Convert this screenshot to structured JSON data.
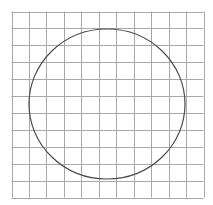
{
  "figure": {
    "grid": {
      "columns": 11,
      "rows": 11,
      "x0": 11.5,
      "y0": 11.5,
      "x1": 203.5,
      "y1": 197.5,
      "line_color": "#a8a8a8",
      "line_width": 1
    },
    "circle": {
      "cx": 107,
      "cy": 104,
      "rx": 78,
      "ry": 75,
      "stroke": "#4a4a4a",
      "stroke_width": 1.2
    },
    "background": "#ffffff"
  }
}
